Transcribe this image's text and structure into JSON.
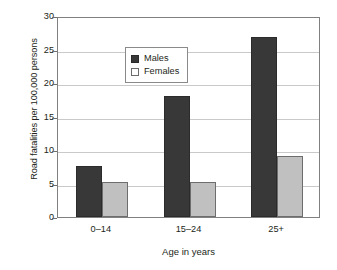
{
  "chart_data": {
    "type": "bar",
    "title": "",
    "xlabel": "Age in years",
    "ylabel": "Road fatalities per 100,000 persons",
    "categories": [
      "0–14",
      "15–24",
      "25+"
    ],
    "series": [
      {
        "name": "Males",
        "values": [
          7.6,
          18.0,
          26.8
        ],
        "color": "#383838"
      },
      {
        "name": "Females",
        "values": [
          5.2,
          5.2,
          9.1
        ],
        "color": "#c0c0c0"
      }
    ],
    "ylim": [
      0,
      30
    ],
    "yticks": [
      0,
      5,
      10,
      15,
      20,
      25,
      30
    ],
    "ytick_labels": [
      "0",
      "5",
      "10",
      "15",
      "20",
      "25",
      "30"
    ],
    "grid": "horizontal",
    "legend_position": "top-left-inside"
  },
  "legend": {
    "items": [
      {
        "label": "Males"
      },
      {
        "label": "Females"
      }
    ]
  }
}
